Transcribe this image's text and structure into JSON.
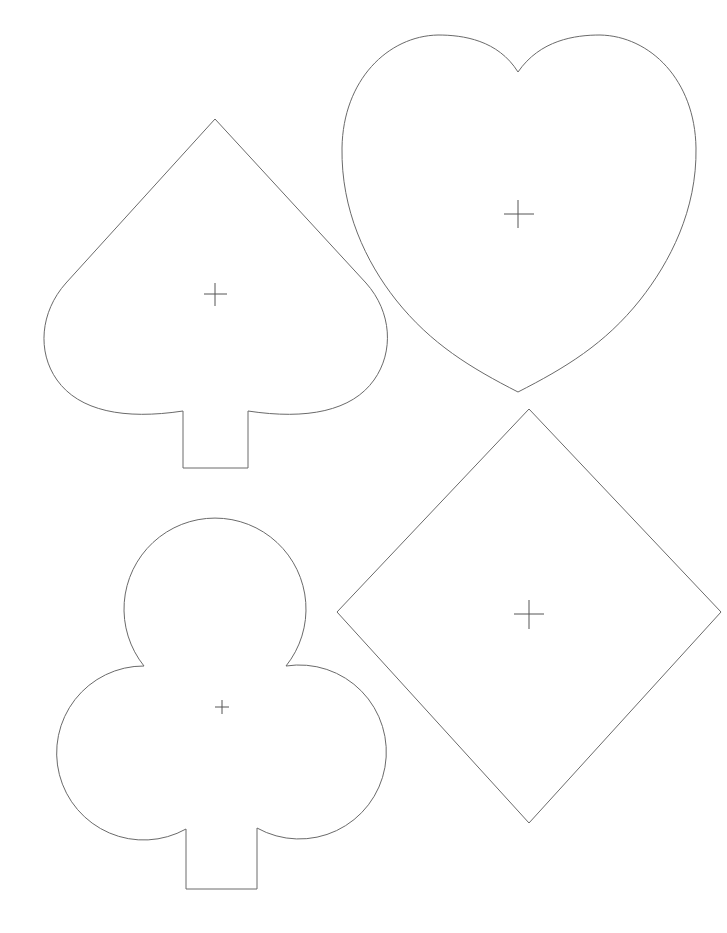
{
  "document": {
    "title": "Card suit templates",
    "stroke_color": "#6a6a6a",
    "crosshair_color": "#555555",
    "background": "#ffffff"
  },
  "shapes": [
    {
      "name": "spade",
      "label": "Spade",
      "icon": "spade-icon",
      "center": [
        215,
        294
      ],
      "bounds": {
        "left": 43,
        "top": 119,
        "right": 387,
        "bottom": 468
      },
      "stem": {
        "left": 183,
        "right": 248,
        "top": 411,
        "bottom": 468
      }
    },
    {
      "name": "heart",
      "label": "Heart",
      "icon": "heart-icon",
      "center": [
        518,
        214
      ],
      "bounds": {
        "left": 342,
        "top": 35,
        "right": 696,
        "bottom": 392
      },
      "cusp": [
        518,
        72
      ]
    },
    {
      "name": "club",
      "label": "Club",
      "icon": "club-icon",
      "center": [
        222,
        707
      ],
      "bounds": {
        "left": 48,
        "top": 524,
        "right": 398,
        "bottom": 889
      },
      "stem": {
        "left": 186,
        "right": 257,
        "top": 829,
        "bottom": 889
      }
    },
    {
      "name": "diamond",
      "label": "Diamond",
      "icon": "diamond-icon",
      "center": [
        529,
        614
      ],
      "bounds": {
        "left": 337,
        "top": 409,
        "right": 721,
        "bottom": 823
      }
    }
  ]
}
